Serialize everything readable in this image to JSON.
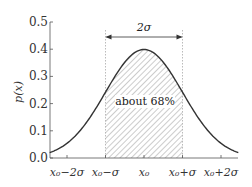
{
  "chart_data": {
    "type": "line",
    "title": "",
    "xlabel": "",
    "ylabel": "p(x)",
    "ylim": [
      0.0,
      0.5
    ],
    "yticks": [
      0.0,
      0.1,
      0.2,
      0.3,
      0.4,
      0.5
    ],
    "ytick_labels": [
      "0.0",
      "0.1",
      "0.2",
      "0.3",
      "0.4",
      "0.5"
    ],
    "xticks_sigma": [
      -2,
      -1,
      0,
      1,
      2
    ],
    "xtick_labels": [
      "x₀−2σ",
      "x₀−σ",
      "x₀",
      "x₀+σ",
      "x₀+2σ"
    ],
    "grid": false,
    "series": [
      {
        "name": "normal pdf",
        "description": "Gaussian density with mean x0 and std sigma",
        "x_sigma": [
          -2.45,
          -2,
          -1.5,
          -1,
          -0.5,
          0,
          0.5,
          1,
          1.5,
          2,
          2.45
        ],
        "values": [
          0.02,
          0.054,
          0.13,
          0.242,
          0.352,
          0.399,
          0.352,
          0.242,
          0.13,
          0.054,
          0.02
        ]
      }
    ],
    "shaded_region": {
      "from_sigma": -1,
      "to_sigma": 1,
      "pattern": "diagonal hatch",
      "label": "about 68%"
    },
    "annotations": [
      {
        "text": "2σ",
        "type": "double-arrow",
        "from_sigma": -1,
        "to_sigma": 1
      },
      {
        "text": "about 68%",
        "type": "label"
      }
    ]
  }
}
